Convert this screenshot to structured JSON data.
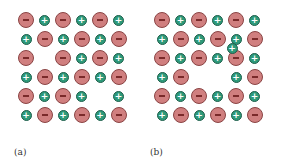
{
  "panels": [
    {
      "label": "(a)",
      "x0": 26,
      "y0": 20,
      "dx": 18.5,
      "dy": 19,
      "grid": [
        "-+-+-+",
        "+-+-+-",
        "- -+-+",
        "+-+-+-",
        "-+-+ +",
        "+-+-+-"
      ],
      "extra": []
    },
    {
      "label": "(b)",
      "x0": 162,
      "y0": 20,
      "dx": 18.5,
      "dy": 19,
      "grid": [
        "-+-+-+",
        "+-+-+-",
        "-+-+-+",
        "+-  +-",
        "-+-+-+",
        "+-+-+-"
      ],
      "extra": [
        {
          "type": "+",
          "x": 232,
          "y": 48
        }
      ]
    }
  ],
  "labels": [
    {
      "text": "(a)",
      "x": 14,
      "y": 147
    },
    {
      "text": "(b)",
      "x": 150,
      "y": 147
    }
  ],
  "colors": {
    "negative": "#d07f7f",
    "positive": "#2e9a7a"
  }
}
